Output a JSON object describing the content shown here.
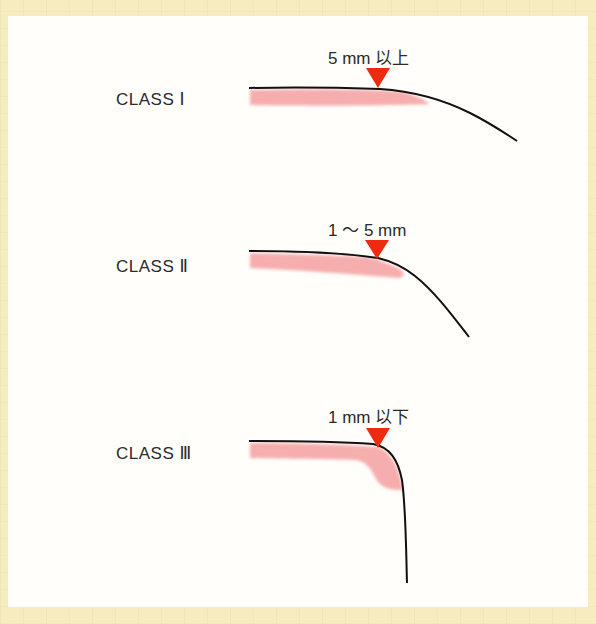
{
  "colors": {
    "frame": "#f6ecbf",
    "panel": "#fffefb",
    "curve": "#111111",
    "shade": "#f4a0a0",
    "marker": "#ee2a10"
  },
  "classes": [
    {
      "label": "CLASS Ⅰ",
      "measure": "5 mm 以上"
    },
    {
      "label": "CLASS Ⅱ",
      "measure": "1 ～ 5 mm"
    },
    {
      "label": "CLASS Ⅲ",
      "measure": "1 mm 以下"
    }
  ]
}
